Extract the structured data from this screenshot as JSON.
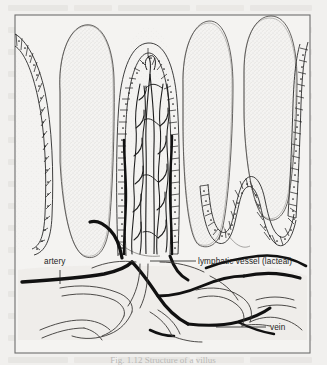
{
  "figure": {
    "frame_color": "#6e6e6e",
    "background_color": "#f1f0ee",
    "ink_color": "#1d1d1d",
    "stipple_color": "#b0aeab",
    "labels": [
      {
        "id": "artery",
        "text": "artery",
        "x": 44,
        "y": 264,
        "anchor": "start"
      },
      {
        "id": "lacteal",
        "text": "lymphatic vessel  (lacteal)",
        "x": 198,
        "y": 264,
        "anchor": "start"
      },
      {
        "id": "vein",
        "text": "vein",
        "x": 270,
        "y": 330,
        "anchor": "start"
      }
    ],
    "caption": "Fig. 1.12  Structure of a villus",
    "vessel_legend": [
      {
        "name": "artery",
        "style": "thick-solid-black"
      },
      {
        "name": "vein",
        "style": "thick-solid-black"
      },
      {
        "name": "lacteal",
        "style": "thin-outline"
      },
      {
        "name": "capillary-network",
        "style": "thin-wavy"
      }
    ]
  }
}
